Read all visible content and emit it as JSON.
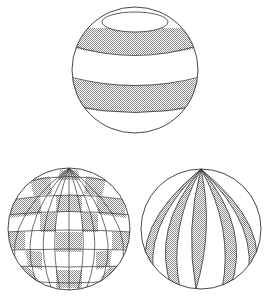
{
  "figure": {
    "colors": {
      "line": "#333333",
      "shade": "#bdbdbd",
      "background": "#ffffff"
    },
    "spheres": [
      {
        "id": "latitude-bands",
        "cx": 135,
        "cy": 70,
        "r": 63,
        "pattern": "horizontal-bands"
      },
      {
        "id": "checkerboard",
        "cx": 69,
        "cy": 229,
        "r": 61,
        "pattern": "lat-long-checkerboard"
      },
      {
        "id": "longitude-gores",
        "cx": 201,
        "cy": 229,
        "r": 60,
        "pattern": "vertical-gores"
      }
    ]
  }
}
